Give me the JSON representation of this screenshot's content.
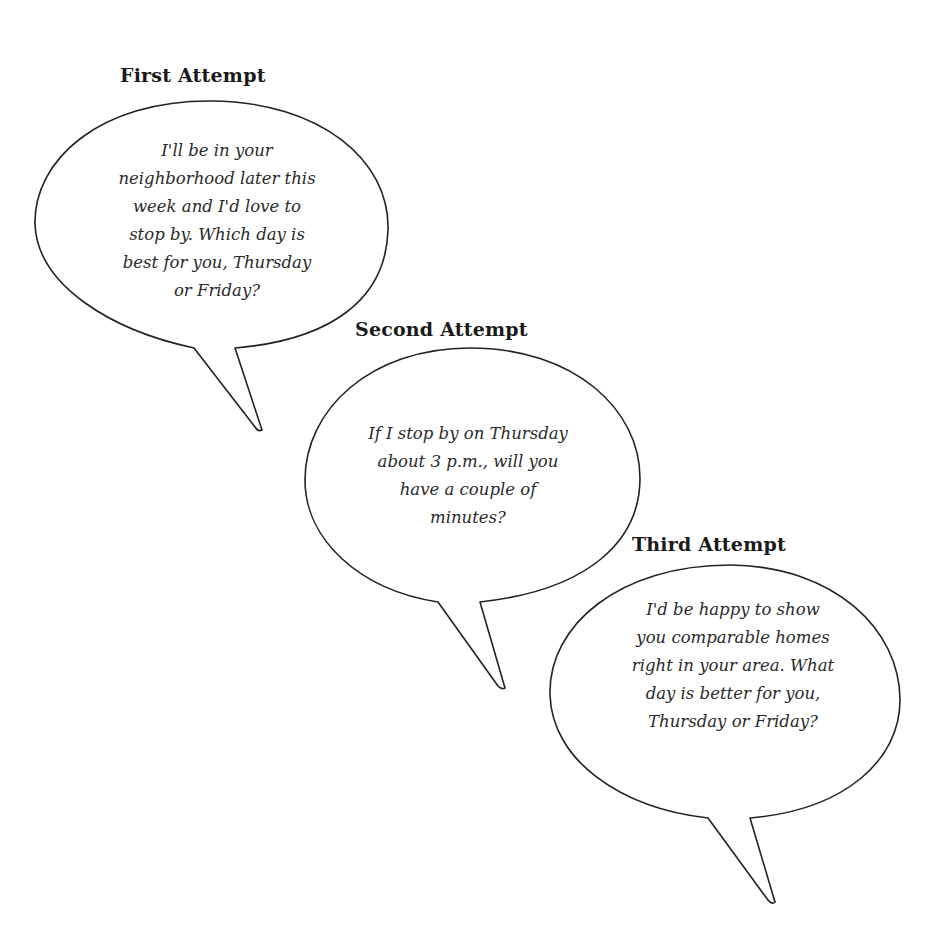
{
  "colors": {
    "stroke": "#222222",
    "background": "#ffffff",
    "text": "#2a2a2a"
  },
  "bubbles": [
    {
      "title": "First Attempt",
      "lines": [
        "I'll be in your",
        "neighborhood later this",
        "week and I'd love to",
        "stop by. Which day is",
        "best for you, Thursday",
        "or Friday?"
      ]
    },
    {
      "title": "Second Attempt",
      "lines": [
        "If I stop by on Thursday",
        "about 3 p.m., will you",
        "have a couple of",
        "minutes?"
      ]
    },
    {
      "title": "Third Attempt",
      "lines": [
        "I'd be happy to show",
        "you comparable homes",
        "right in your area. What",
        "day is better for you,",
        "Thursday or Friday?"
      ]
    }
  ]
}
